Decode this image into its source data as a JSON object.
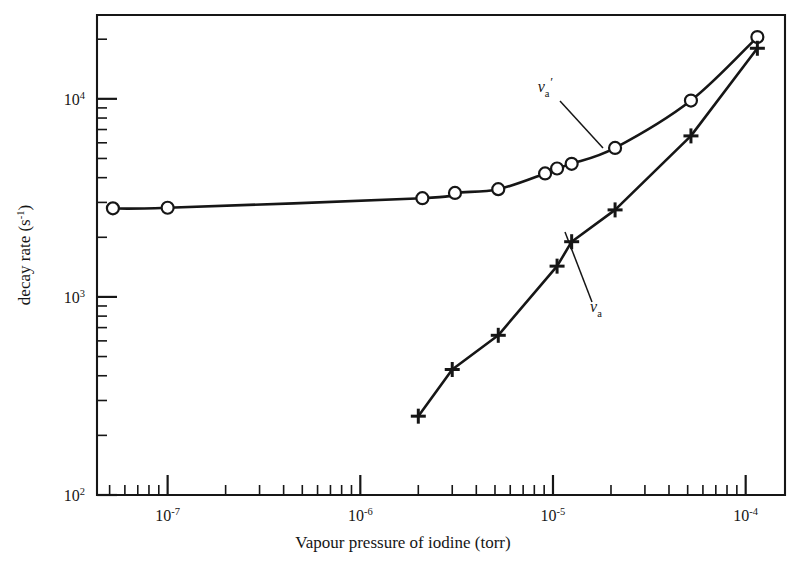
{
  "figure": {
    "background_color": "#ffffff",
    "ink_color": "#161616",
    "axes": {
      "frame": {
        "left_px": 97,
        "right_px": 785,
        "top_px": 15,
        "bottom_px": 495
      },
      "x": {
        "title": "Vapour pressure of iodine (torr)",
        "scale": "log",
        "unit": "torr",
        "range": [
          4.3e-08,
          0.00016
        ],
        "tick_labels": [
          "10⁻⁷",
          "10⁻⁶",
          "10⁻⁵",
          "10⁻⁴"
        ],
        "tick_mantissa": [
          "10",
          "10",
          "10",
          "10"
        ],
        "tick_exponents": [
          "-7",
          "-6",
          "-5",
          "-4"
        ],
        "tick_values": [
          1e-07,
          1e-06,
          1e-05,
          0.0001
        ],
        "minor_ticks": "2-9 per decade"
      },
      "y": {
        "title": "decay rate (s⁻¹)",
        "title_base": "decay rate (s",
        "title_exponent": "-1",
        "title_tail": ")",
        "scale": "log",
        "unit": "s⁻¹",
        "range": [
          100,
          26500
        ],
        "tick_labels": [
          "10²",
          "10³",
          "10⁴"
        ],
        "tick_mantissa": [
          "10",
          "10",
          "10"
        ],
        "tick_exponents": [
          "2",
          "3",
          "4"
        ],
        "tick_values": [
          100,
          1000,
          10000
        ],
        "minor_ticks": "2-9 per decade"
      }
    },
    "annotations": [
      {
        "name": "nu-a-prime-label",
        "symbol": "ν",
        "subscript": "a",
        "prime": "′",
        "text": "νa′",
        "x_px": 545,
        "y_px": 92
      },
      {
        "name": "nu-a-label",
        "symbol": "ν",
        "subscript": "a",
        "prime": "",
        "text": "νa",
        "x_px": 596,
        "y_px": 312
      }
    ]
  },
  "chart_data": {
    "type": "scatter",
    "title": "",
    "xlabel": "Vapour pressure of iodine (torr)",
    "ylabel": "decay rate (s⁻¹)",
    "xscale": "log",
    "yscale": "log",
    "xlim": [
      4.3e-08,
      0.00016
    ],
    "ylim": [
      100,
      26500
    ],
    "grid": false,
    "legend": "inline annotations",
    "series": [
      {
        "name": "νa′",
        "label": "nu_a_prime",
        "marker": "open-circle",
        "line": "smooth curve",
        "x": [
          5.2e-08,
          1e-07,
          2.1e-06,
          3.1e-06,
          5.2e-06,
          9.1e-06,
          1.05e-05,
          1.25e-05,
          2.1e-05,
          5.2e-05,
          0.000115
        ],
        "y": [
          2800,
          2820,
          3150,
          3350,
          3500,
          4200,
          4450,
          4700,
          5650,
          9800,
          20500
        ]
      },
      {
        "name": "νa",
        "label": "nu_a",
        "marker": "plus",
        "line": "straight",
        "x": [
          2e-06,
          3e-06,
          5.2e-06,
          1.05e-05,
          1.25e-05,
          2.1e-05,
          5.2e-05,
          0.000115
        ],
        "y": [
          250,
          430,
          640,
          1430,
          1900,
          2750,
          6500,
          18000
        ]
      }
    ]
  }
}
